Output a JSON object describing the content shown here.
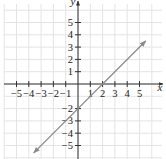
{
  "chart_data": {
    "type": "line",
    "title": "",
    "xlabel": "x",
    "ylabel": "y",
    "xlim": [
      -5.5,
      5.5
    ],
    "ylim": [
      -5.5,
      5.5
    ],
    "grid": true,
    "legend": null,
    "x_ticks": [
      -5,
      -4,
      -3,
      -2,
      -1,
      1,
      2,
      3,
      4,
      5
    ],
    "x_tick_labels": [
      "−5",
      "−4",
      "−3",
      "−2",
      "−1",
      "1",
      "2",
      "3",
      "4",
      "5"
    ],
    "y_ticks": [
      5,
      4,
      3,
      2,
      1,
      -2,
      -3,
      -4,
      -5
    ],
    "y_tick_labels": [
      "5",
      "4",
      "3",
      "2",
      "1",
      "−2",
      "−3",
      "−4",
      "−5"
    ],
    "series": [
      {
        "name": "line",
        "equation": "y = x - 2",
        "slope": 1,
        "intercept": -2,
        "x": [
          -3.6,
          5.5
        ],
        "y": [
          -5.6,
          3.5
        ],
        "arrows": "both",
        "color": "#8a8a8a"
      }
    ]
  },
  "colors": {
    "axis": "#333333",
    "grid": "#e4e4e4",
    "line": "#8a8a8a"
  },
  "labels": {
    "x_axis": "x",
    "y_axis": "y"
  }
}
